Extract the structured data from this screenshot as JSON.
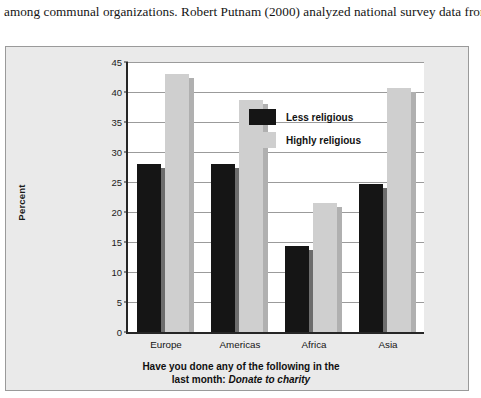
{
  "page": {
    "body_text": "among communal organizations. Robert Putnam (2000) analyzed national survey data from"
  },
  "chart_data": {
    "type": "bar",
    "title": "",
    "subtitle": "",
    "xlabel_line1": "Have you done any of the following in the",
    "xlabel_line2_prefix": "last month: ",
    "xlabel_line2_italic": "Donate to charity",
    "ylabel": "Percent",
    "categories": [
      "Europe",
      "Americas",
      "Africa",
      "Asia"
    ],
    "series": [
      {
        "name": "Less religious",
        "color": "#151515",
        "values": [
          28.0,
          28.0,
          14.3,
          24.7
        ]
      },
      {
        "name": "Highly religious",
        "color": "#cfcfcf",
        "values": [
          43.0,
          38.6,
          21.5,
          40.7
        ]
      }
    ],
    "ylim": [
      0,
      45
    ],
    "ytick_values": [
      0,
      5,
      10,
      15,
      20,
      25,
      30,
      35,
      40,
      45
    ],
    "ytick_labels": [
      "0",
      "5",
      "10",
      "15",
      "20",
      "25",
      "30",
      "35",
      "40",
      "45"
    ],
    "grid": true,
    "grid_axis": "y",
    "legend_position": "top-right",
    "background": "#eaeaea",
    "plot_background": "#ffffff"
  }
}
